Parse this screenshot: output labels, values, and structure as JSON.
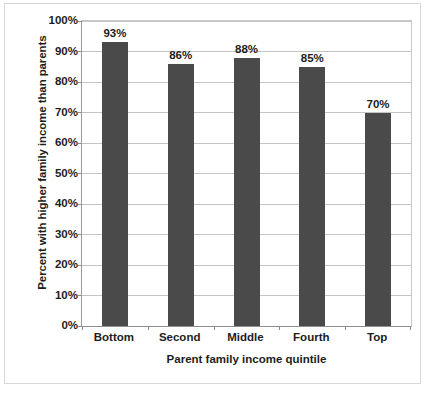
{
  "chart_data": {
    "type": "bar",
    "title": "",
    "categories": [
      "Bottom",
      "Second",
      "Middle",
      "Fourth",
      "Top"
    ],
    "values": [
      93,
      86,
      88,
      85,
      70
    ],
    "data_labels": [
      "93%",
      "86%",
      "88%",
      "85%",
      "70%"
    ],
    "xlabel": "Parent family income quintile",
    "ylabel": "Percent with higher family income than parents",
    "ylim": [
      0,
      100
    ],
    "ytick_values": [
      0,
      10,
      20,
      30,
      40,
      50,
      60,
      70,
      80,
      90,
      100
    ],
    "ytick_labels": [
      "0%",
      "10%",
      "20%",
      "30%",
      "40%",
      "50%",
      "60%",
      "70%",
      "80%",
      "90%",
      "100%"
    ],
    "grid": true,
    "legend": false,
    "colors": {
      "bar": "#4a4a4a",
      "gridline": "#c4c4c4",
      "axis": "#8e8e8e",
      "text": "#1d1d1d",
      "background": "#ffffff"
    }
  }
}
